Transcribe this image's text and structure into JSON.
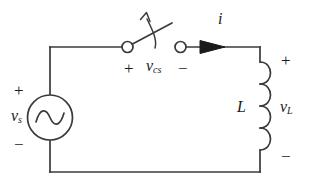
{
  "figure": {
    "name": "ac-source-switch-inductor-circuit",
    "type": "electrical-schematic",
    "background_color": "#ffffff",
    "line_color": "#3a3a3a",
    "text_color": "#1a1a1a"
  },
  "source": {
    "symbol": "ac-voltage-source",
    "plus_sign": "+",
    "minus_sign": "−",
    "label": "v",
    "label_subscript": "s"
  },
  "switch": {
    "symbol": "single-pole-single-throw-open-switch",
    "plus_sign": "+",
    "minus_sign": "−",
    "label": "v",
    "label_subscript": "cs",
    "actuation_arrow": "curved-up-arrow"
  },
  "current": {
    "label": "i",
    "arrow_direction": "right"
  },
  "inductor": {
    "symbol": "inductor-coil",
    "coil_turns": 4,
    "designator": "L",
    "plus_sign": "+",
    "minus_sign": "−",
    "label": "v",
    "label_subscript": "L"
  }
}
